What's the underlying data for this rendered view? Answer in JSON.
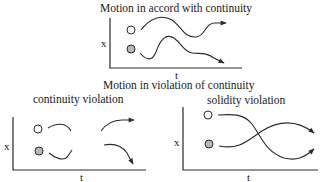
{
  "title_top": "Motion in accord with continuity",
  "title_middle": "Motion in violation of continuity",
  "panels": [
    {
      "id": "continuity",
      "label": "",
      "x_axis_label": "t",
      "y_axis_label": "x",
      "objects": [
        {
          "name": "white-ball",
          "fill": "#ffffff"
        },
        {
          "name": "gray-ball",
          "fill": "#b8b8b8"
        }
      ]
    },
    {
      "id": "continuity-violation",
      "label": "continuity violation",
      "x_axis_label": "t",
      "y_axis_label": "x",
      "objects": [
        {
          "name": "white-ball",
          "fill": "#ffffff"
        },
        {
          "name": "gray-ball",
          "fill": "#b8b8b8"
        }
      ]
    },
    {
      "id": "solidity-violation",
      "label": "solidity violation",
      "x_axis_label": "t",
      "y_axis_label": "x",
      "objects": [
        {
          "name": "white-ball",
          "fill": "#ffffff"
        },
        {
          "name": "gray-ball",
          "fill": "#b8b8b8"
        }
      ]
    }
  ],
  "colors": {
    "line": "#2a2a2a",
    "ball_gray": "#b8b8b8"
  }
}
